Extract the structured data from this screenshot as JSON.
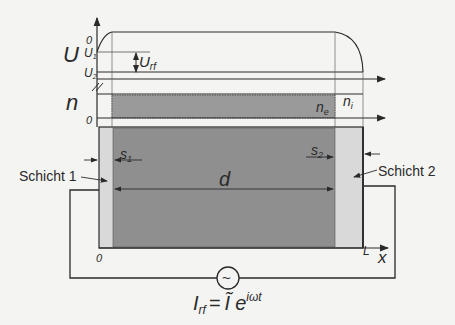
{
  "diagram": {
    "potential_axis": {
      "label": "U",
      "ticks": {
        "zero": "0",
        "u1": "U",
        "u1_sub": "1",
        "u2": "U",
        "u2_sub": "2"
      },
      "amplitude_label": "U",
      "amplitude_sub": "rf"
    },
    "density_axis": {
      "label": "n",
      "zero": "0",
      "electron_label": "n",
      "electron_sub": "e",
      "ion_label": "n",
      "ion_sub": "i"
    },
    "geometry": {
      "sheath1_label": "s",
      "sheath1_sub": "1",
      "sheath2_label": "s",
      "sheath2_sub": "2",
      "bulk_width_label": "d",
      "layer1_label": "Schicht 1",
      "layer2_label": "Schicht 2",
      "x_origin": "0",
      "x_end": "L",
      "x_axis_label": "x"
    },
    "source": {
      "symbol": "~",
      "current_label": "I",
      "current_sub": "rf",
      "equals": "=",
      "amplitude": "Ĩ",
      "exp_base": "e",
      "exp_power": "iωt"
    },
    "colors": {
      "background": "#f4f4f2",
      "line": "#2a2a2a",
      "bulk_fill": "#8f8f8f",
      "sheath_fill": "#d9d9d9",
      "electron_band": "#9a9a9a"
    }
  }
}
